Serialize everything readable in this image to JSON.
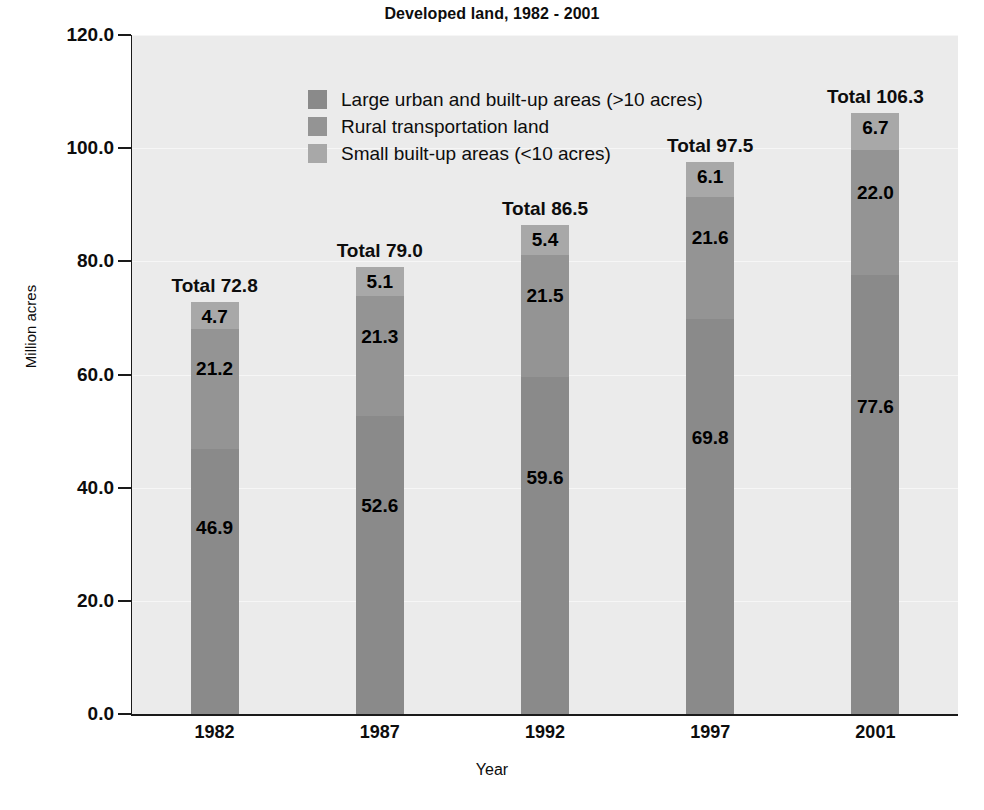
{
  "chart_data": {
    "type": "bar",
    "subtype": "stacked-vertical",
    "title": "Developed land, 1982 - 2001",
    "xlabel": "Year",
    "ylabel": "Million acres",
    "categories": [
      "1982",
      "1987",
      "1992",
      "1997",
      "2001"
    ],
    "ylim": [
      0.0,
      120.0
    ],
    "ytick_step": 20.0,
    "ytick_labels": [
      "0.0",
      "20.0",
      "40.0",
      "60.0",
      "80.0",
      "100.0",
      "120.0"
    ],
    "ytick_values": [
      0.0,
      20.0,
      40.0,
      60.0,
      80.0,
      100.0,
      120.0
    ],
    "grid": true,
    "legend_position": "top-left-inside",
    "series": [
      {
        "name": "Large urban and built-up areas (>10 acres)",
        "color": "#8a8a8a",
        "values": [
          46.9,
          52.6,
          59.6,
          69.8,
          77.6
        ],
        "labels": [
          "46.9",
          "52.6",
          "59.6",
          "69.8",
          "77.6"
        ]
      },
      {
        "name": "Rural transportation land",
        "color": "#949494",
        "values": [
          21.2,
          21.3,
          21.5,
          21.6,
          22.0
        ],
        "labels": [
          "21.2",
          "21.3",
          "21.5",
          "21.6",
          "22.0"
        ]
      },
      {
        "name": "Small built-up areas (<10 acres)",
        "color": "#a8a8a8",
        "values": [
          4.7,
          5.1,
          5.4,
          6.1,
          6.7
        ],
        "labels": [
          "4.7",
          "5.1",
          "5.4",
          "6.1",
          "6.7"
        ]
      }
    ],
    "totals": [
      72.8,
      79.0,
      86.5,
      97.5,
      106.3
    ],
    "total_labels": [
      "Total 72.8",
      "Total 79.0",
      "Total 86.5",
      "Total 97.5",
      "Total 106.3"
    ],
    "annotations": {
      "total_prefix": "Total"
    },
    "colors": {
      "plot_background": "#ebebeb",
      "page_background": "#ffffff",
      "axis": "#1a1a1a",
      "gridline": "#f6f6f6",
      "text": "#0d0d0d"
    }
  }
}
